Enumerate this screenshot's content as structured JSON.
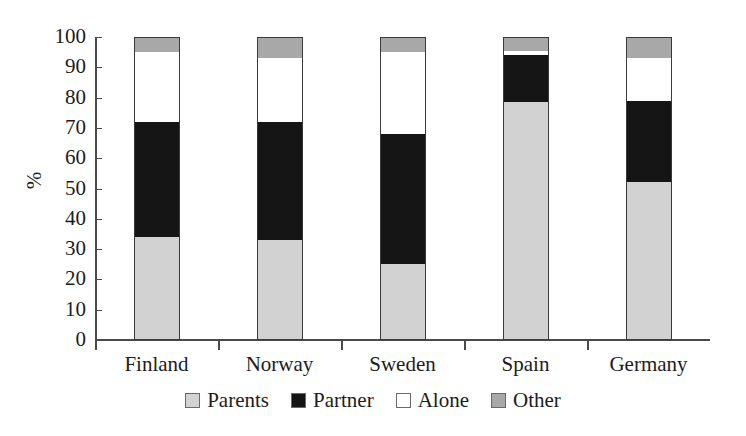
{
  "chart_data": {
    "type": "bar",
    "subtype": "stacked-bar-100",
    "title": "",
    "xlabel": "",
    "ylabel": "%",
    "ylim": [
      0,
      100
    ],
    "ytick_step": 10,
    "yticks": [
      0,
      10,
      20,
      30,
      40,
      50,
      60,
      70,
      80,
      90,
      100
    ],
    "ytick_labels": [
      "0",
      "10",
      "20",
      "30",
      "40",
      "50",
      "60",
      "70",
      "80",
      "90",
      "100"
    ],
    "grid": false,
    "legend_position": "bottom",
    "categories": [
      "Finland",
      "Norway",
      "Sweden",
      "Spain",
      "Germany"
    ],
    "series": [
      {
        "name": "Parents",
        "color": "#d2d2d2",
        "values": [
          34,
          33,
          25,
          78.5,
          52
        ]
      },
      {
        "name": "Partner",
        "color": "#151515",
        "values": [
          38,
          39,
          43,
          15.5,
          27
        ]
      },
      {
        "name": "Alone",
        "color": "#ffffff",
        "values": [
          23,
          21,
          27,
          1.5,
          14
        ]
      },
      {
        "name": "Other",
        "color": "#a8a8a8",
        "values": [
          5,
          7,
          5,
          4.5,
          7
        ]
      }
    ],
    "cumulative_tops": {
      "Finland": [
        34,
        72,
        95,
        100
      ],
      "Norway": [
        33,
        72,
        93,
        100
      ],
      "Sweden": [
        25,
        68,
        95,
        100
      ],
      "Spain": [
        78.5,
        94,
        95.5,
        100
      ],
      "Germany": [
        52,
        79,
        93,
        100
      ]
    }
  },
  "legend": {
    "items": [
      {
        "label": "Parents",
        "color": "#d2d2d2"
      },
      {
        "label": "Partner",
        "color": "#151515"
      },
      {
        "label": "Alone",
        "color": "#ffffff"
      },
      {
        "label": "Other",
        "color": "#a8a8a8"
      }
    ]
  },
  "axis": {
    "y_title": "%"
  }
}
